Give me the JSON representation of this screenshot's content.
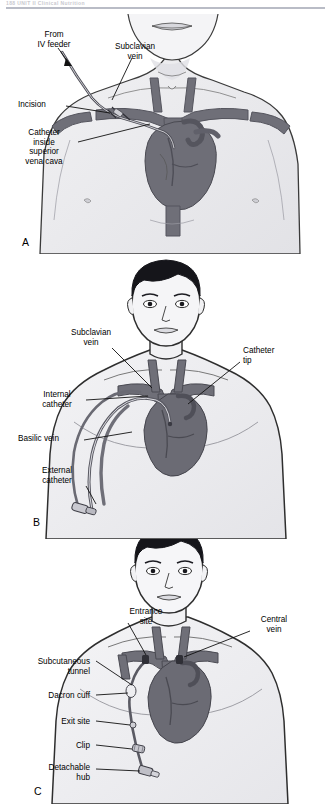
{
  "runhead": {
    "text": "188     UNIT II     Clinical Nutrition"
  },
  "figure": {
    "colors": {
      "vessel_dark": "#6f6f78",
      "vessel_mid": "#8d8d96",
      "heart": "#6e6e77",
      "skin_line": "#3a3a3a",
      "hair": "#15151a",
      "catheter": "#5d5d66",
      "shade": "#e9e9ec"
    },
    "panels": [
      {
        "key": "A",
        "id": "panel-a",
        "caption_key": "A",
        "labels": [
          {
            "name": "label-from-iv-feeder",
            "text": "From\nIV feeder",
            "x": 26,
            "y": 16,
            "align": "center",
            "w": 56
          },
          {
            "name": "label-subclavian-vein",
            "text": "Subclavian\nvein",
            "x": 104,
            "y": 28,
            "align": "center",
            "w": 62
          },
          {
            "name": "label-incision",
            "text": "Incision",
            "x": 18,
            "y": 86,
            "align": "left",
            "w": 46
          },
          {
            "name": "label-catheter-inside-svc",
            "text": "Catheter\ninside\nsuperior\nvena cava",
            "x": 14,
            "y": 114,
            "align": "center",
            "w": 60
          }
        ]
      },
      {
        "key": "B",
        "id": "panel-b",
        "caption_key": "B",
        "labels": [
          {
            "name": "label-subclavian-vein",
            "text": "Subclavian\nvein",
            "x": 62,
            "y": 74,
            "align": "center",
            "w": 58
          },
          {
            "name": "label-catheter-tip",
            "text": "Catheter\ntip",
            "x": 243,
            "y": 92,
            "align": "left",
            "w": 50
          },
          {
            "name": "label-internal-catheter",
            "text": "Internal\ncatheter",
            "x": 30,
            "y": 136,
            "align": "center",
            "w": 54
          },
          {
            "name": "label-basilic-vein",
            "text": "Basilic vein",
            "x": 18,
            "y": 180,
            "align": "left",
            "w": 62
          },
          {
            "name": "label-external-catheter",
            "text": "External\ncatheter",
            "x": 30,
            "y": 212,
            "align": "center",
            "w": 54
          }
        ]
      },
      {
        "key": "C",
        "id": "panel-c",
        "caption_key": "C",
        "labels": [
          {
            "name": "label-entrance-site",
            "text": "Entrance\nsite",
            "x": 118,
            "y": 68,
            "align": "center",
            "w": 56
          },
          {
            "name": "label-central-vein",
            "text": "Central\nvein",
            "x": 248,
            "y": 76,
            "align": "center",
            "w": 52
          },
          {
            "name": "label-subcutaneous-tunnel",
            "text": "Subcutaneous\ntunnel",
            "x": 10,
            "y": 118,
            "align": "right",
            "w": 80
          },
          {
            "name": "label-dacron-cuff",
            "text": "Dacron cuff",
            "x": 10,
            "y": 152,
            "align": "right",
            "w": 80
          },
          {
            "name": "label-exit-site",
            "text": "Exit site",
            "x": 10,
            "y": 178,
            "align": "right",
            "w": 80
          },
          {
            "name": "label-clip",
            "text": "Clip",
            "x": 10,
            "y": 204,
            "align": "right",
            "w": 80
          },
          {
            "name": "label-detachable-hub",
            "text": "Detachable\nhub",
            "x": 10,
            "y": 226,
            "align": "right",
            "w": 80
          }
        ]
      }
    ]
  }
}
